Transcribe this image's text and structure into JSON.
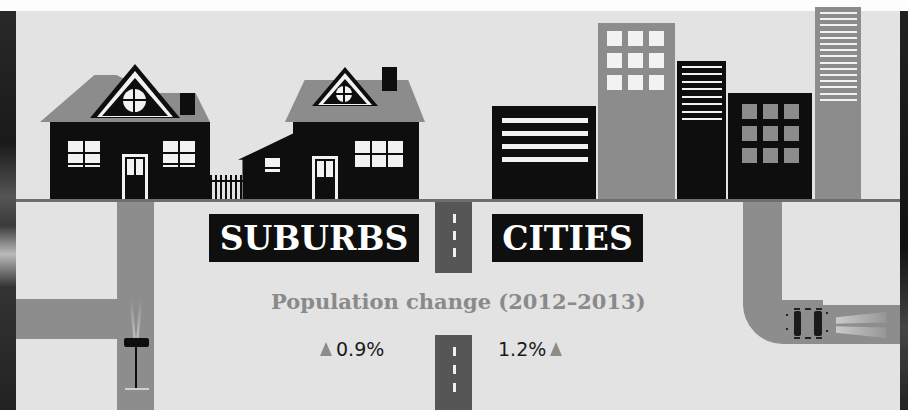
{
  "labels": {
    "suburbs": "SUBURBS",
    "cities": "CITIES"
  },
  "subtitle": "Population change (2012–2013)",
  "stats": {
    "suburbs": {
      "value": "0.9%",
      "direction": "up"
    },
    "cities": {
      "value": "1.2%",
      "direction": "up"
    }
  },
  "icons": {
    "up_arrow": "▲"
  },
  "colors": {
    "background": "#e3e3e3",
    "black": "#0e0e0e",
    "gray": "#8c8c8c",
    "road_dark": "#565656",
    "subtitle_text": "#8a8a8a"
  }
}
